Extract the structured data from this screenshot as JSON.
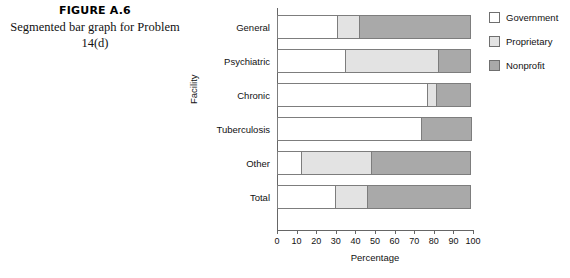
{
  "figure": {
    "number": "FIGURE A.6",
    "caption": "Segmented bar graph for Problem 14(d)"
  },
  "colors": {
    "government": "#ffffff",
    "proprietary": "#e3e3e3",
    "nonprofit": "#a9a9a9",
    "outline": "#7d7d7d",
    "axis": "#666666"
  },
  "chart_data": {
    "type": "bar",
    "orientation": "horizontal",
    "stacked": true,
    "percent_stacked": true,
    "title": "",
    "xlabel": "Percentage",
    "ylabel": "Facility",
    "xlim": [
      0,
      100
    ],
    "xticks": [
      "0",
      "10",
      "20",
      "30",
      "40",
      "50",
      "60",
      "70",
      "80",
      "90",
      "100"
    ],
    "grid": false,
    "legend_position": "right",
    "categories": [
      "General",
      "Psychiatric",
      "Chronic",
      "Tuberculosis",
      "Other",
      "Total"
    ],
    "series": [
      {
        "name": "Government",
        "values": [
          31,
          35,
          77,
          74,
          13,
          30
        ]
      },
      {
        "name": "Proprietary",
        "values": [
          12,
          48,
          5,
          0,
          36,
          17
        ]
      },
      {
        "name": "Nonprofit",
        "values": [
          57,
          17,
          18,
          26,
          51,
          53
        ]
      }
    ]
  }
}
